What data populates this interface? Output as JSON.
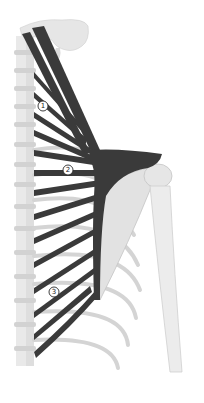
{
  "figure": {
    "colors": {
      "background": "#ffffff",
      "bone": "#e4e4e4",
      "bone_shade": "#c8c8c8",
      "muscle": "#3a3a3a"
    },
    "labels": [
      {
        "id": "label-1",
        "text": "1",
        "x": 43,
        "y": 106
      },
      {
        "id": "label-2",
        "text": "2",
        "x": 68,
        "y": 170
      },
      {
        "id": "label-3",
        "text": "3",
        "x": 54,
        "y": 292
      }
    ]
  }
}
